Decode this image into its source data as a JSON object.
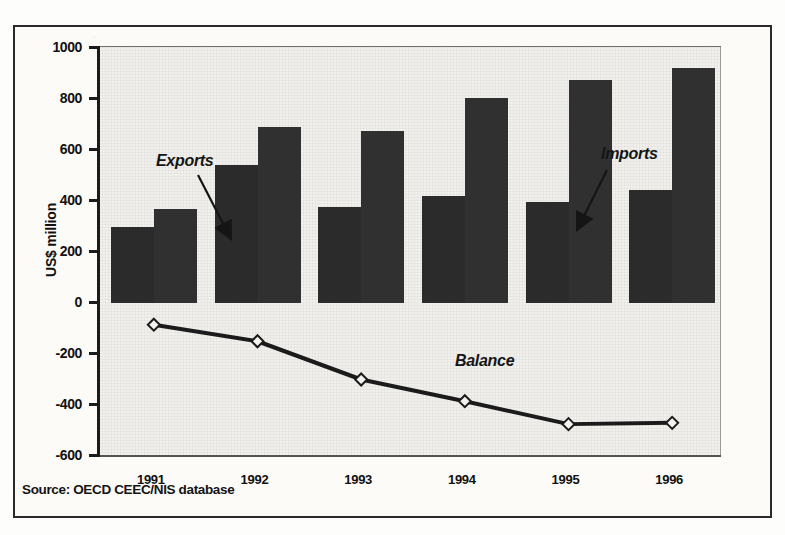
{
  "figure": {
    "source_note": "Source: OECD CEEC/NIS database"
  },
  "chart_data": {
    "type": "bar",
    "title": "",
    "subtitle": "",
    "xlabel": "",
    "ylabel": "US$ million",
    "categories": [
      "1991",
      "1992",
      "1993",
      "1994",
      "1995",
      "1996"
    ],
    "ylim": [
      -600,
      1000
    ],
    "ytick_labels": [
      "1000",
      "800",
      "600",
      "400",
      "200",
      "0",
      "-200",
      "-400",
      "-600"
    ],
    "ytick_values": [
      1000,
      800,
      600,
      400,
      200,
      0,
      -200,
      -400,
      -600
    ],
    "grid": false,
    "legend_position": "annotations-in-plot",
    "bar_color": "#2b2b2b",
    "line_color": "#1b1b1b",
    "series": [
      {
        "name": "Exports",
        "kind": "bar",
        "values": [
          300,
          540,
          375,
          420,
          395,
          445
        ]
      },
      {
        "name": "Imports",
        "kind": "bar",
        "values": [
          370,
          690,
          675,
          805,
          875,
          920
        ]
      },
      {
        "name": "Balance",
        "kind": "line",
        "marker": "diamond",
        "values": [
          -85,
          -150,
          -300,
          -385,
          -475,
          -470
        ]
      }
    ],
    "annotations": [
      {
        "text": "Exports",
        "points_to": "1992 exports bar"
      },
      {
        "text": "Imports",
        "points_to": "1995 imports bar"
      },
      {
        "text": "Balance",
        "points_to": "balance line"
      }
    ]
  }
}
